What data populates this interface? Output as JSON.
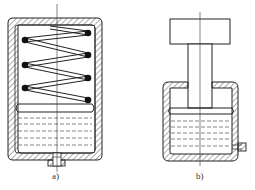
{
  "figure": {
    "type": "technical-diagram",
    "colors": {
      "line": "#222222",
      "background": "#ffffff",
      "hatch": "#444444",
      "liquid_dash": "#666666"
    }
  },
  "panels": [
    {
      "id": "a",
      "label": "a)",
      "elements": [
        "hatched-housing",
        "coil-spring",
        "piston",
        "hydraulic-fluid",
        "bottom-port",
        "centerline"
      ]
    },
    {
      "id": "b",
      "label": "b)",
      "elements": [
        "weight-block",
        "piston-rod",
        "hatched-housing",
        "piston",
        "hydraulic-fluid",
        "side-port",
        "centerline"
      ]
    }
  ]
}
